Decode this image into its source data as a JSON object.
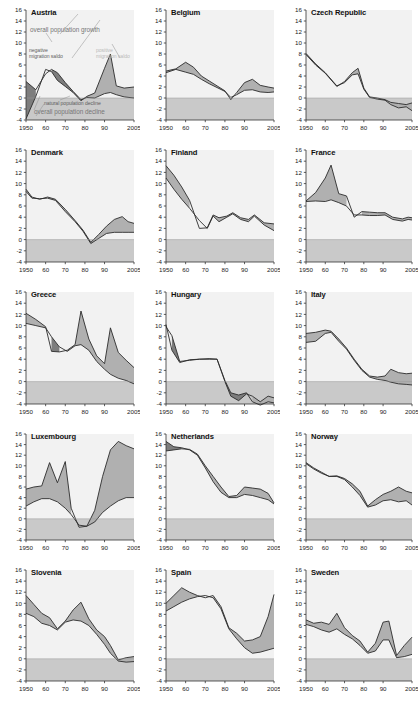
{
  "figure": {
    "type": "small-multiples",
    "panel_count": 15,
    "columns": 3,
    "rows": 5
  },
  "axes": {
    "ylim": [
      -4,
      16
    ],
    "yticks": [
      -4,
      -2,
      0,
      2,
      4,
      6,
      8,
      10,
      12,
      14,
      16
    ],
    "ytick_labels": [
      "-4",
      "-2",
      "0",
      "2",
      "4",
      "6",
      "8",
      "10",
      "12",
      "14",
      "16"
    ],
    "xlim": [
      1950,
      2005
    ],
    "xticks": [
      1950,
      1960,
      1970,
      1980,
      1990,
      2005
    ],
    "xtick_labels": [
      "1950",
      "60",
      "70",
      "80",
      "90",
      "2005"
    ],
    "ylabel": "",
    "xlabel": "",
    "grid": false,
    "negative_band_fill": "#c9c9c9",
    "plot_bg": "#f2f2f2"
  },
  "colors": {
    "dark_band": "#7d7d7d",
    "light_band": "#b0b0b0",
    "line": "#2b2b2b",
    "negative_zone": "#c9c9c9",
    "axis": "#333333",
    "annotation_grey": "#6f6f6f",
    "annotation_light": "#b9b9b9"
  },
  "legend": {
    "annotations": [
      {
        "label": "overall population growth",
        "style": "big"
      },
      {
        "label": "negative migration saldo",
        "style": "dark"
      },
      {
        "label": "positive migration saldo",
        "style": "light"
      },
      {
        "label": "natural population decline",
        "style": "dark"
      },
      {
        "label": "overall population decline",
        "style": "big"
      }
    ]
  },
  "chart_data": [
    {
      "type": "area",
      "title": "Austria",
      "xlabel": "",
      "ylabel": "",
      "xlim": [
        1950,
        2005
      ],
      "ylim": [
        -4,
        16
      ],
      "x": [
        1950,
        1955,
        1960,
        1963,
        1966,
        1970,
        1974,
        1978,
        1981,
        1985,
        1990,
        1993,
        1996,
        2000,
        2005
      ],
      "series": [
        {
          "name": "natural population change",
          "values": [
            3.0,
            1.5,
            4.4,
            5.2,
            4.6,
            2.8,
            1.2,
            -0.3,
            0.1,
            0.0,
            0.8,
            1.0,
            0.6,
            0.2,
            0.0
          ]
        },
        {
          "name": "overall population change",
          "values": [
            -3.8,
            0.3,
            5.2,
            4.8,
            3.2,
            2.1,
            1.0,
            -0.5,
            0.3,
            0.9,
            5.4,
            8.0,
            2.2,
            1.8,
            2.0
          ]
        }
      ]
    },
    {
      "type": "area",
      "title": "Belgium",
      "xlabel": "",
      "ylabel": "",
      "xlim": [
        1950,
        2005
      ],
      "ylim": [
        -4,
        16
      ],
      "x": [
        1950,
        1955,
        1960,
        1964,
        1968,
        1972,
        1976,
        1980,
        1983,
        1986,
        1990,
        1994,
        1998,
        2002,
        2005
      ],
      "series": [
        {
          "name": "natural population change",
          "values": [
            4.6,
            5.2,
            4.7,
            4.3,
            3.4,
            2.6,
            1.9,
            1.2,
            0.1,
            0.6,
            1.4,
            1.5,
            1.1,
            1.0,
            1.1
          ]
        },
        {
          "name": "overall population change",
          "values": [
            4.9,
            5.3,
            6.5,
            5.6,
            4.0,
            3.1,
            2.2,
            1.3,
            -0.3,
            1.0,
            2.8,
            3.4,
            2.3,
            2.0,
            1.8
          ]
        }
      ]
    },
    {
      "type": "area",
      "title": "Czech Republic",
      "xlabel": "",
      "ylabel": "",
      "xlim": [
        1950,
        2005
      ],
      "ylim": [
        -4,
        16
      ],
      "x": [
        1950,
        1955,
        1960,
        1966,
        1970,
        1974,
        1977,
        1980,
        1983,
        1987,
        1991,
        1994,
        1998,
        2002,
        2005
      ],
      "series": [
        {
          "name": "natural population change",
          "values": [
            8.1,
            6.2,
            4.6,
            2.2,
            2.8,
            4.2,
            4.4,
            1.6,
            0.1,
            -0.2,
            -0.4,
            -1.2,
            -1.8,
            -1.6,
            -2.3
          ]
        },
        {
          "name": "overall population change",
          "values": [
            7.9,
            6.0,
            4.5,
            2.1,
            3.0,
            4.6,
            5.4,
            1.8,
            0.2,
            0.0,
            -0.3,
            -0.8,
            -1.0,
            -1.2,
            -0.9
          ]
        }
      ]
    },
    {
      "type": "area",
      "title": "Denmark",
      "xlabel": "",
      "ylabel": "",
      "xlim": [
        1950,
        2005
      ],
      "ylim": [
        -4,
        16
      ],
      "x": [
        1950,
        1953,
        1957,
        1961,
        1965,
        1970,
        1975,
        1979,
        1983,
        1987,
        1991,
        1995,
        1999,
        2002,
        2005
      ],
      "series": [
        {
          "name": "natural population change",
          "values": [
            8.6,
            7.4,
            7.3,
            7.4,
            7.0,
            5.0,
            3.2,
            1.5,
            -0.7,
            0.2,
            1.1,
            1.3,
            1.3,
            1.3,
            1.3
          ]
        },
        {
          "name": "overall population change",
          "values": [
            9.0,
            7.6,
            7.2,
            7.6,
            7.2,
            5.4,
            3.4,
            1.7,
            -0.5,
            0.9,
            2.4,
            3.6,
            4.1,
            3.2,
            2.9
          ]
        }
      ]
    },
    {
      "type": "area",
      "title": "Finland",
      "xlabel": "",
      "ylabel": "",
      "xlim": [
        1950,
        2005
      ],
      "ylim": [
        -4,
        16
      ],
      "x": [
        1950,
        1954,
        1958,
        1962,
        1967,
        1971,
        1974,
        1977,
        1981,
        1984,
        1988,
        1992,
        1995,
        2000,
        2005
      ],
      "series": [
        {
          "name": "natural population change",
          "values": [
            11.0,
            9.0,
            7.2,
            5.6,
            3.4,
            2.0,
            4.2,
            3.2,
            4.0,
            4.6,
            3.6,
            3.2,
            4.2,
            2.6,
            1.6
          ]
        },
        {
          "name": "overall population change",
          "values": [
            13.2,
            11.5,
            9.4,
            7.0,
            2.0,
            2.1,
            4.4,
            3.9,
            4.2,
            4.8,
            3.9,
            3.6,
            4.4,
            3.0,
            2.8
          ]
        }
      ]
    },
    {
      "type": "area",
      "title": "France",
      "xlabel": "",
      "ylabel": "",
      "xlim": [
        1950,
        2005
      ],
      "ylim": [
        -4,
        16
      ],
      "x": [
        1950,
        1955,
        1960,
        1963,
        1967,
        1971,
        1975,
        1979,
        1983,
        1987,
        1991,
        1995,
        2000,
        2003,
        2005
      ],
      "series": [
        {
          "name": "natural population change",
          "values": [
            6.8,
            6.9,
            6.8,
            7.1,
            6.6,
            6.0,
            4.4,
            4.4,
            4.3,
            4.3,
            4.4,
            3.6,
            3.3,
            3.6,
            3.5
          ]
        },
        {
          "name": "overall population change",
          "values": [
            6.9,
            8.4,
            11.0,
            13.3,
            8.2,
            7.8,
            4.0,
            5.0,
            4.9,
            4.8,
            4.8,
            4.0,
            3.7,
            4.0,
            3.9
          ]
        }
      ]
    },
    {
      "type": "area",
      "title": "Greece",
      "xlabel": "",
      "ylabel": "",
      "xlim": [
        1950,
        2005
      ],
      "ylim": [
        -4,
        16
      ],
      "x": [
        1950,
        1955,
        1960,
        1963,
        1967,
        1971,
        1975,
        1978,
        1982,
        1986,
        1990,
        1993,
        1997,
        2001,
        2005
      ],
      "series": [
        {
          "name": "natural population change",
          "values": [
            10.4,
            10.0,
            9.6,
            8.0,
            6.2,
            5.4,
            6.4,
            6.6,
            5.6,
            3.6,
            2.2,
            1.3,
            0.6,
            0.2,
            -0.4
          ]
        },
        {
          "name": "overall population change",
          "values": [
            12.2,
            11.1,
            9.8,
            5.4,
            5.3,
            5.6,
            6.6,
            12.6,
            7.6,
            4.6,
            3.2,
            9.6,
            5.2,
            3.8,
            2.5
          ]
        }
      ]
    },
    {
      "type": "area",
      "title": "Hungary",
      "xlabel": "",
      "ylabel": "",
      "xlim": [
        1950,
        2005
      ],
      "ylim": [
        -4,
        16
      ],
      "x": [
        1950,
        1953,
        1957,
        1962,
        1967,
        1972,
        1976,
        1980,
        1983,
        1987,
        1991,
        1994,
        1998,
        2002,
        2005
      ],
      "series": [
        {
          "name": "natural population change",
          "values": [
            9.8,
            8.2,
            3.6,
            3.8,
            4.0,
            4.0,
            4.0,
            0.2,
            -2.0,
            -2.4,
            -2.0,
            -3.6,
            -4.2,
            -3.6,
            -3.8
          ]
        },
        {
          "name": "overall population change",
          "values": [
            10.2,
            5.6,
            3.4,
            3.9,
            4.0,
            4.1,
            4.0,
            0.0,
            -2.6,
            -3.4,
            -2.2,
            -2.6,
            -3.6,
            -2.6,
            -2.9
          ]
        }
      ]
    },
    {
      "type": "area",
      "title": "Italy",
      "xlabel": "",
      "ylabel": "",
      "xlim": [
        1950,
        2005
      ],
      "ylim": [
        -4,
        16
      ],
      "x": [
        1950,
        1955,
        1960,
        1963,
        1967,
        1971,
        1975,
        1979,
        1983,
        1987,
        1991,
        1994,
        1998,
        2002,
        2005
      ],
      "series": [
        {
          "name": "natural population change",
          "values": [
            7.0,
            7.2,
            8.6,
            8.8,
            7.2,
            5.8,
            3.8,
            2.0,
            0.8,
            0.4,
            0.2,
            -0.1,
            -0.4,
            -0.5,
            -0.6
          ]
        },
        {
          "name": "overall population change",
          "values": [
            8.6,
            8.8,
            9.2,
            9.0,
            7.6,
            6.0,
            4.0,
            2.2,
            1.0,
            0.8,
            1.0,
            2.2,
            1.6,
            1.4,
            1.5
          ]
        }
      ]
    },
    {
      "type": "area",
      "title": "Luxembourg",
      "xlabel": "",
      "ylabel": "",
      "xlim": [
        1950,
        2005
      ],
      "ylim": [
        -4,
        16
      ],
      "x": [
        1950,
        1954,
        1958,
        1962,
        1966,
        1970,
        1973,
        1977,
        1981,
        1985,
        1989,
        1993,
        1997,
        2001,
        2005
      ],
      "series": [
        {
          "name": "natural population change",
          "values": [
            2.4,
            3.2,
            3.8,
            3.8,
            3.2,
            2.0,
            0.8,
            -1.2,
            -1.4,
            -0.6,
            1.2,
            2.4,
            3.4,
            4.0,
            4.0
          ]
        },
        {
          "name": "overall population change",
          "values": [
            5.6,
            6.0,
            6.2,
            10.6,
            6.8,
            10.8,
            2.0,
            -1.6,
            -1.4,
            1.6,
            8.0,
            13.0,
            14.6,
            13.8,
            13.2
          ]
        }
      ]
    },
    {
      "type": "area",
      "title": "Netherlands",
      "xlabel": "",
      "ylabel": "",
      "xlim": [
        1950,
        2005
      ],
      "ylim": [
        -4,
        16
      ],
      "x": [
        1950,
        1954,
        1958,
        1962,
        1966,
        1970,
        1974,
        1978,
        1982,
        1986,
        1990,
        1994,
        1998,
        2002,
        2005
      ],
      "series": [
        {
          "name": "natural population change",
          "values": [
            14.6,
            13.6,
            13.4,
            13.0,
            12.0,
            9.6,
            7.0,
            5.0,
            4.0,
            4.0,
            4.6,
            4.4,
            4.0,
            3.6,
            2.8
          ]
        },
        {
          "name": "overall population change",
          "values": [
            12.8,
            13.0,
            13.2,
            13.1,
            12.2,
            10.0,
            8.0,
            6.0,
            4.2,
            4.4,
            6.0,
            5.8,
            5.6,
            4.8,
            3.0
          ]
        }
      ]
    },
    {
      "type": "area",
      "title": "Norway",
      "xlabel": "",
      "ylabel": "",
      "xlim": [
        1950,
        2005
      ],
      "ylim": [
        -4,
        16
      ],
      "x": [
        1950,
        1954,
        1958,
        1962,
        1966,
        1970,
        1974,
        1978,
        1982,
        1986,
        1990,
        1994,
        1998,
        2002,
        2005
      ],
      "series": [
        {
          "name": "natural population change",
          "values": [
            10.4,
            9.4,
            8.6,
            8.0,
            8.0,
            7.4,
            6.0,
            4.4,
            2.2,
            2.6,
            3.4,
            3.6,
            3.2,
            3.4,
            2.6
          ]
        },
        {
          "name": "overall population change",
          "values": [
            10.6,
            9.6,
            8.8,
            8.0,
            8.1,
            7.6,
            6.6,
            5.2,
            2.4,
            3.6,
            4.6,
            5.2,
            6.0,
            5.2,
            4.9
          ]
        }
      ]
    },
    {
      "type": "area",
      "title": "Slovenia",
      "xlabel": "",
      "ylabel": "",
      "xlim": [
        1950,
        2005
      ],
      "ylim": [
        -4,
        16
      ],
      "x": [
        1950,
        1954,
        1958,
        1962,
        1966,
        1970,
        1974,
        1978,
        1982,
        1986,
        1990,
        1993,
        1997,
        2001,
        2005
      ],
      "series": [
        {
          "name": "natural population change",
          "values": [
            8.2,
            7.6,
            6.4,
            6.0,
            5.2,
            6.6,
            7.0,
            6.8,
            6.0,
            4.4,
            2.6,
            1.0,
            -0.4,
            -0.6,
            -0.5
          ]
        },
        {
          "name": "overall population change",
          "values": [
            11.4,
            9.8,
            8.2,
            7.4,
            5.4,
            6.8,
            8.8,
            10.2,
            7.2,
            5.2,
            4.0,
            2.4,
            -0.2,
            0.2,
            0.4
          ]
        }
      ]
    },
    {
      "type": "area",
      "title": "Spain",
      "xlabel": "",
      "ylabel": "",
      "xlim": [
        1950,
        2005
      ],
      "ylim": [
        -4,
        16
      ],
      "x": [
        1950,
        1954,
        1958,
        1962,
        1966,
        1970,
        1974,
        1978,
        1982,
        1986,
        1990,
        1994,
        1998,
        2002,
        2005
      ],
      "series": [
        {
          "name": "natural population change",
          "values": [
            8.6,
            9.4,
            10.2,
            10.8,
            11.2,
            11.4,
            11.0,
            9.0,
            5.4,
            3.6,
            2.0,
            1.0,
            1.2,
            1.6,
            1.9
          ]
        },
        {
          "name": "overall population change",
          "values": [
            10.0,
            11.4,
            12.8,
            12.0,
            11.4,
            11.0,
            11.4,
            9.4,
            5.6,
            4.6,
            3.2,
            3.4,
            4.0,
            7.6,
            11.6
          ]
        }
      ]
    },
    {
      "type": "area",
      "title": "Sweden",
      "xlabel": "",
      "ylabel": "",
      "xlim": [
        1950,
        2005
      ],
      "ylim": [
        -4,
        16
      ],
      "x": [
        1950,
        1954,
        1958,
        1962,
        1966,
        1970,
        1974,
        1978,
        1982,
        1986,
        1990,
        1993,
        1997,
        2001,
        2005
      ],
      "series": [
        {
          "name": "natural population change",
          "values": [
            6.2,
            5.8,
            5.2,
            4.8,
            5.4,
            4.4,
            3.6,
            2.4,
            1.0,
            1.4,
            3.4,
            3.4,
            0.2,
            0.4,
            0.8
          ]
        },
        {
          "name": "overall population change",
          "values": [
            7.0,
            6.4,
            6.6,
            6.2,
            8.2,
            5.6,
            4.2,
            3.2,
            1.2,
            2.8,
            6.6,
            6.8,
            0.6,
            2.4,
            3.9
          ]
        }
      ]
    }
  ]
}
